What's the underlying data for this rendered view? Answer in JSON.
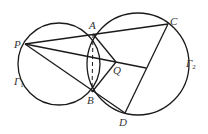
{
  "diagram": {
    "colors": {
      "stroke": "#1a1a1a",
      "label": "#333333",
      "background": "#ffffff"
    },
    "points": {
      "P": {
        "label": "P",
        "x": 25,
        "y": 44
      },
      "A": {
        "label": "A",
        "x": 93,
        "y": 34
      },
      "B": {
        "label": "B",
        "x": 92,
        "y": 92
      },
      "C": {
        "label": "C",
        "x": 168,
        "y": 24
      },
      "D": {
        "label": "D",
        "x": 125,
        "y": 113
      },
      "Q": {
        "label": "Q",
        "x": 116,
        "y": 62
      }
    },
    "circles": [
      {
        "name": "Γ1",
        "label": "Γ",
        "sub": "1",
        "cx": 59,
        "cy": 64,
        "r": 41
      },
      {
        "name": "Γ2",
        "label": "Γ",
        "sub": "2",
        "cx": 138,
        "cy": 64,
        "r": 51
      }
    ],
    "labels": {
      "P": "P",
      "A": "A",
      "B": "B",
      "C": "C",
      "D": "D",
      "Q": "Q",
      "gamma": "Γ",
      "gamma1_sub": "1",
      "gamma2_sub": "2"
    }
  }
}
